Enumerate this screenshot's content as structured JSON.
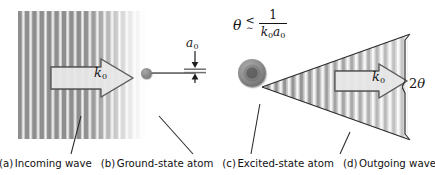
{
  "figure": {
    "kind": "physics-schematic",
    "title_alt": "Light scattering from an atom: incoming plane wave, ground-state atom, excited-state atom and outgoing diffracted wave"
  },
  "panels": {
    "incoming_wave": {
      "caption_tag": "(a)",
      "caption_text": "Incoming wave",
      "arrow_label": "k",
      "arrow_label_sub": "0"
    },
    "ground_state_atom": {
      "caption_tag": "(b)",
      "caption_text": "Ground-state atom",
      "size_label": "a",
      "size_label_sub": "0"
    },
    "excited_state_atom": {
      "caption_tag": "(c)",
      "caption_text": "Excited-state atom"
    },
    "outgoing_wave": {
      "caption_tag": "(d)",
      "caption_text": "Outgoing wave",
      "arrow_label": "k",
      "arrow_label_sub": "0",
      "cone_angle_label": "2",
      "cone_angle_symbol": "θ"
    }
  },
  "formula": {
    "theta": "θ",
    "relation_top": "<",
    "relation_bottom": "∼",
    "numerator": "1",
    "denominator_k": "k",
    "denominator_k_sub": "0",
    "denominator_a": "a",
    "denominator_a_sub": "0",
    "plain": "θ ≲ 1 / (k0 a0)"
  },
  "colors": {
    "wave_dark": "#8e8e8e",
    "wave_light": "#f2f2f2",
    "atom_fill": "#8f8f8f",
    "line": "#2a2a2a",
    "text": "#111111",
    "background": "#ffffff"
  }
}
